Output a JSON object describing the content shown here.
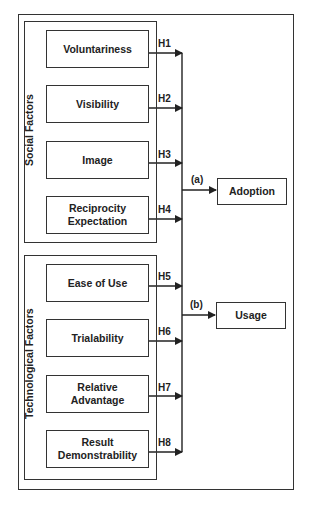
{
  "diagram": {
    "groups": [
      {
        "label": "Social Factors",
        "factors": [
          {
            "label": "Voluntariness",
            "hypothesis": "H1"
          },
          {
            "label": "Visibility",
            "hypothesis": "H2"
          },
          {
            "label": "Image",
            "hypothesis": "H3"
          },
          {
            "label": "Reciprocity Expectation",
            "hypothesis": "H4"
          }
        ]
      },
      {
        "label": "Technological Factors",
        "factors": [
          {
            "label": "Ease of Use",
            "hypothesis": "H5"
          },
          {
            "label": "Trialability",
            "hypothesis": "H6"
          },
          {
            "label": "Relative Advantage",
            "hypothesis": "H7"
          },
          {
            "label": "Result Demonstrability",
            "hypothesis": "H8"
          }
        ]
      }
    ],
    "outcomes": [
      {
        "label": "Adoption",
        "path": "(a)"
      },
      {
        "label": "Usage",
        "path": "(b)"
      }
    ],
    "colors": {
      "line": "#333333",
      "text": "#222222",
      "background": "#ffffff"
    }
  }
}
